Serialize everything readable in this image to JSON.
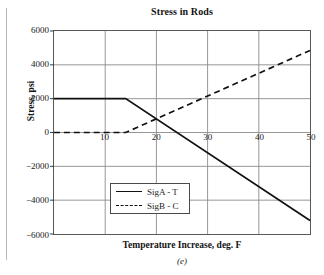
{
  "figure": {
    "caption": "(e)"
  },
  "chart_data": {
    "type": "line",
    "title": "Stress in Rods",
    "xlabel": "Temperature Increase, deg. F",
    "ylabel": "Stress, psi",
    "xlim": [
      0,
      50
    ],
    "ylim": [
      -6000,
      6000
    ],
    "xticks": [
      10,
      20,
      30,
      40,
      50
    ],
    "yticks": [
      6000,
      4000,
      2000,
      0,
      -2000,
      -4000,
      -6000
    ],
    "xtick_labels": [
      "10",
      "20",
      "30",
      "40",
      "50"
    ],
    "ytick_labels": [
      "6000",
      "4000",
      "2000",
      "0",
      "-2000",
      "-4000",
      "-6000"
    ],
    "grid": true,
    "legend_position": "center-left",
    "series": [
      {
        "name": "SigA - T",
        "style": "solid",
        "color": "#111111",
        "x": [
          0,
          14,
          50
        ],
        "values": [
          2000,
          2000,
          -5200
        ]
      },
      {
        "name": "SigB - C",
        "style": "dashed",
        "color": "#111111",
        "x": [
          0,
          14,
          50
        ],
        "values": [
          0,
          0,
          4850
        ]
      }
    ],
    "annotations": {
      "intersection_x": 21,
      "intersection_y": 800
    }
  },
  "legend": {
    "items": [
      {
        "label": "SigA - T",
        "style": "solid"
      },
      {
        "label": "SigB - C",
        "style": "dashed"
      }
    ]
  }
}
